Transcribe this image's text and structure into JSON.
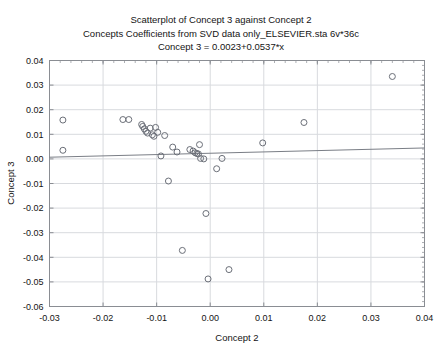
{
  "title": {
    "line1": "Scatterplot of Concept 3 against Concept 2",
    "line2": "Concepts Coefficients from SVD data only_ELSEVIER.sta 6v*36c",
    "line3": "Concept 3 = 0.0023+0.0537*x"
  },
  "colors": {
    "marker_stroke": "#6b6f78",
    "trend_line": "#7a7e86",
    "grid": "#d8dade",
    "frame": "#8a8d93",
    "text": "#141414",
    "background": "#ffffff"
  },
  "chart_data": {
    "type": "scatter",
    "title": "Scatterplot of Concept 3 against Concept 2",
    "subtitle": "Concepts Coefficients from SVD data only_ELSEVIER.sta 6v*36c",
    "annotation": "Concept 3 = 0.0023+0.0537*x",
    "xlabel": "Concept 2",
    "ylabel": "Concept 3",
    "xlim": [
      -0.03,
      0.04
    ],
    "ylim": [
      -0.06,
      0.04
    ],
    "xticks": [
      -0.03,
      -0.02,
      -0.01,
      0.0,
      0.01,
      0.02,
      0.03,
      0.04
    ],
    "xticklabels": [
      "-0.03",
      "-0.02",
      "-0.01",
      "0.00",
      "0.01",
      "0.02",
      "0.03",
      "0.04"
    ],
    "yticks": [
      -0.06,
      -0.05,
      -0.04,
      -0.03,
      -0.02,
      -0.01,
      0.0,
      0.01,
      0.02,
      0.03,
      0.04
    ],
    "yticklabels": [
      "-0.06",
      "-0.05",
      "-0.04",
      "-0.03",
      "-0.02",
      "-0.01",
      "0.00",
      "0.01",
      "0.02",
      "0.03",
      "0.04"
    ],
    "grid": true,
    "legend": false,
    "marker": "open-circle",
    "n_points": 36,
    "fit": {
      "type": "linear",
      "intercept": 0.0023,
      "slope": 0.0537,
      "equation": "Concept 3 = 0.0023+0.0537*x"
    },
    "x": [
      -0.0275,
      -0.0275,
      -0.0163,
      -0.0152,
      -0.0128,
      -0.0126,
      -0.0123,
      -0.012,
      -0.0117,
      -0.0112,
      -0.0108,
      -0.0105,
      -0.0102,
      -0.0098,
      -0.0092,
      -0.0085,
      -0.0078,
      -0.007,
      -0.0062,
      -0.0052,
      -0.0038,
      -0.0032,
      -0.0028,
      -0.0025,
      -0.0022,
      -0.002,
      -0.0018,
      -0.0012,
      -0.0008,
      -0.0004,
      0.0012,
      0.0022,
      0.0035,
      0.0098,
      0.0175,
      0.034
    ],
    "y": [
      0.0158,
      0.0035,
      0.016,
      0.016,
      0.014,
      0.0132,
      0.0122,
      0.0112,
      0.0105,
      0.0125,
      0.0098,
      0.0092,
      0.0128,
      0.0108,
      0.0012,
      0.0095,
      -0.009,
      0.0048,
      0.0028,
      -0.0372,
      0.0038,
      0.0032,
      0.0025,
      0.0022,
      0.002,
      0.0058,
      0.0002,
      0.0,
      -0.0222,
      -0.0488,
      -0.004,
      0.0002,
      -0.045,
      0.0065,
      0.0148,
      0.0335
    ]
  }
}
